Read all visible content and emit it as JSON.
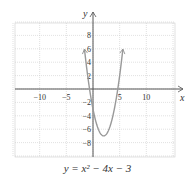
{
  "chart_data": {
    "type": "line",
    "title": "y = x² − 4x − 3",
    "function": "x^2 - 4x - 3",
    "xlabel": "x",
    "ylabel": "y",
    "xlim": [
      -15,
      15
    ],
    "ylim": [
      -10,
      10
    ],
    "x_ticks": [
      -10,
      -5,
      5,
      10
    ],
    "y_ticks": [
      8,
      6,
      4,
      2,
      -2,
      -4,
      -6,
      -8
    ],
    "grid": true,
    "vertex": [
      2,
      -7
    ],
    "x": [
      -1.5,
      -1,
      0,
      1,
      2,
      3,
      4,
      5,
      5.5
    ],
    "y": [
      5.25,
      2,
      -3,
      -6,
      -7,
      -6,
      -3,
      2,
      5.25
    ]
  },
  "caption": "y = x² − 4x − 3"
}
